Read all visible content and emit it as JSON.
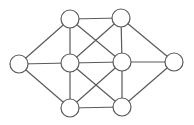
{
  "diagram": {
    "type": "undirected-graph",
    "width": 194,
    "height": 125,
    "node_radius": 9,
    "stroke_color": "#5a5a5a",
    "fill_color": "#ffffff",
    "background_color": "#ffffff",
    "nodes": [
      {
        "id": "L",
        "label": "",
        "x": 19,
        "y": 64
      },
      {
        "id": "TL",
        "label": "",
        "x": 70,
        "y": 19
      },
      {
        "id": "TR",
        "label": "",
        "x": 121,
        "y": 18
      },
      {
        "id": "CL",
        "label": "",
        "x": 70,
        "y": 63
      },
      {
        "id": "CR",
        "label": "",
        "x": 122,
        "y": 62
      },
      {
        "id": "R",
        "label": "",
        "x": 174,
        "y": 62
      },
      {
        "id": "BL",
        "label": "",
        "x": 70,
        "y": 108
      },
      {
        "id": "BR",
        "label": "",
        "x": 122,
        "y": 107
      }
    ],
    "edges": [
      [
        "L",
        "TL"
      ],
      [
        "L",
        "CL"
      ],
      [
        "L",
        "BL"
      ],
      [
        "TL",
        "TR"
      ],
      [
        "TL",
        "CL"
      ],
      [
        "TL",
        "CR"
      ],
      [
        "TR",
        "CL"
      ],
      [
        "TR",
        "CR"
      ],
      [
        "TR",
        "R"
      ],
      [
        "CL",
        "CR"
      ],
      [
        "CL",
        "BL"
      ],
      [
        "CL",
        "BR"
      ],
      [
        "CR",
        "R"
      ],
      [
        "CR",
        "BL"
      ],
      [
        "CR",
        "BR"
      ],
      [
        "R",
        "BR"
      ],
      [
        "BL",
        "BR"
      ]
    ]
  }
}
